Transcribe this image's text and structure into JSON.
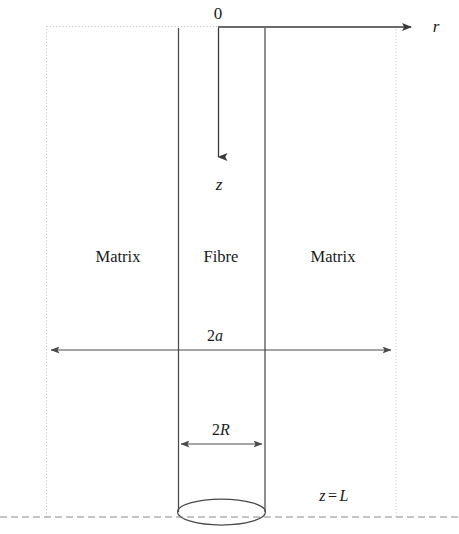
{
  "figure": {
    "width": 459,
    "height": 534,
    "background": "#ffffff",
    "line_color": "#3a3a3a",
    "faint_line_color": "#b9b9b9",
    "text_color": "#1a1a1a"
  },
  "axes": {
    "origin_label": "0",
    "radial_axis_label": "r",
    "axial_axis_label": "z",
    "origin_x": 218,
    "origin_y": 27,
    "radial_arrow_tip_x": 415,
    "axial_arrow_tip_y": 162
  },
  "regions": {
    "left_matrix_label": "Matrix",
    "fibre_label": "Fibre",
    "right_matrix_label": "Matrix"
  },
  "dimensions": {
    "outer_label": "2a",
    "outer_label_number": "2",
    "outer_label_symbol": "a",
    "fibre_label": "2R",
    "fibre_label_number": "2",
    "fibre_label_symbol": "R",
    "outer_span_x1": 47,
    "outer_span_x2": 395,
    "outer_span_y": 350,
    "fibre_span_x1": 178,
    "fibre_span_x2": 265,
    "fibre_span_y": 444
  },
  "boundary": {
    "bottom_label": "z = L",
    "bottom_label_symbol_z": "z",
    "bottom_label_equals": "=",
    "bottom_label_symbol_L": "L",
    "bottom_line_y": 517
  },
  "geometry": {
    "matrix_left_x": 46,
    "matrix_right_x": 396,
    "fibre_left_x": 178,
    "fibre_right_x": 265,
    "top_y": 26,
    "ellipse_cx": 221.5,
    "ellipse_cy": 512,
    "ellipse_rx": 44,
    "ellipse_ry": 13
  }
}
